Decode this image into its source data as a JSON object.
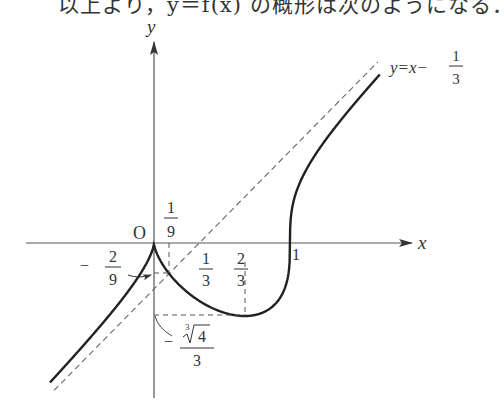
{
  "caption": "以上より，y＝f(x) の概形は次のようになる．",
  "chart_data": {
    "type": "line",
    "function": "f(x) = cbrt(x^2 (x - 1))",
    "xlabel": "x",
    "ylabel": "y",
    "origin_label": "O",
    "x_range": [
      -0.77,
      1.67
    ],
    "y_range": [
      -1.1,
      1.45
    ],
    "grid": false,
    "series": [
      {
        "name": "y = f(x)",
        "style": "solid",
        "points": [
          [
            -0.765,
            -1.01
          ],
          [
            -0.5,
            -0.72
          ],
          [
            -0.25,
            -0.43
          ],
          [
            0,
            0
          ],
          [
            0.111,
            -0.222
          ],
          [
            0.333,
            -0.416
          ],
          [
            0.667,
            -0.529
          ],
          [
            0.9,
            -0.433
          ],
          [
            1,
            0
          ],
          [
            1.2,
            0.66
          ],
          [
            1.65,
            1.31
          ]
        ]
      },
      {
        "name": "y = x - 1/3",
        "style": "dashed",
        "label": "y=x−",
        "label_frac": {
          "num": "1",
          "den": "3"
        }
      }
    ],
    "annotations": {
      "x_ticks": [
        {
          "value": 0.1111,
          "num": "1",
          "den": "9",
          "position": "above"
        },
        {
          "value": 0.3333,
          "num": "1",
          "den": "3",
          "position": "below"
        },
        {
          "value": 0.6667,
          "num": "2",
          "den": "3",
          "position": "below"
        },
        {
          "value": 1,
          "text": "1",
          "position": "below"
        }
      ],
      "y_ticks": [
        {
          "value": -0.2222,
          "sign": "−",
          "num": "2",
          "den": "9",
          "arrow": true
        },
        {
          "value": -0.5291,
          "sign": "−",
          "num": "∛4",
          "num_root_index": "3",
          "num_radicand": "4",
          "den": "3"
        }
      ],
      "critical_points": [
        {
          "name": "cusp",
          "x": 0,
          "y": 0
        },
        {
          "name": "asymptote intersection",
          "x": 0.1111,
          "y": -0.2222
        },
        {
          "name": "minimum",
          "x": 0.6667,
          "y": -0.5291
        },
        {
          "name": "x-intercept",
          "x": 1,
          "y": 0
        }
      ]
    }
  },
  "colors": {
    "curve": "#222222",
    "axis": "#555555",
    "dashed": "#666666"
  }
}
